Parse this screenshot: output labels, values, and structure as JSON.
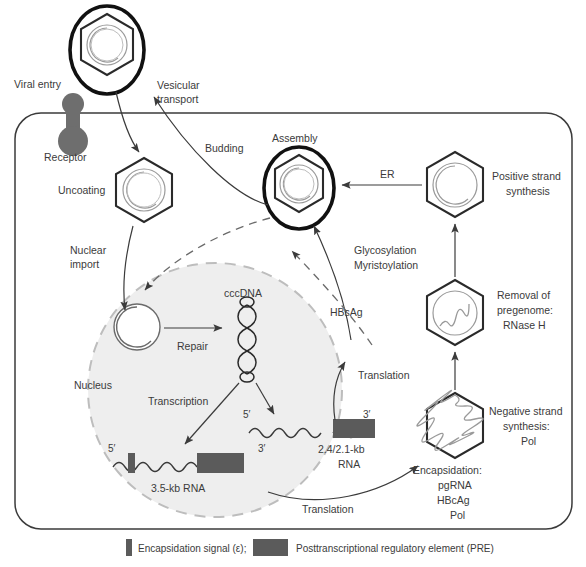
{
  "diagram": {
    "colors": {
      "stroke": "#3b3b3b",
      "envelope": "#1a1a1a",
      "nucleus_fill": "#eeeeee",
      "nucleus_stroke": "#b9b9b9",
      "receptor": "#6e6e6e",
      "pre_box": "#5b5b5b",
      "eps_bar": "#5b5b5b",
      "text": "#3b3b3b",
      "background": "#ffffff"
    },
    "labels": {
      "viral_entry": "Viral entry",
      "receptor": "Receptor",
      "vesicular_transport_line1": "Vesicular",
      "vesicular_transport_line2": "transport",
      "uncoating": "Uncoating",
      "budding": "Budding",
      "assembly": "Assembly",
      "er": "ER",
      "positive_strand_line1": "Positive strand",
      "positive_strand_line2": "synthesis",
      "nuclear_import_line1": "Nuclear",
      "nuclear_import_line2": "import",
      "nucleus": "Nucleus",
      "cccdna": "cccDNA",
      "repair": "Repair",
      "transcription": "Transcription",
      "glycosylation": "Glycosylation",
      "myristoylation": "Myristoylation",
      "hbsag": "HBsAg",
      "translation_upper": "Translation",
      "translation_lower": "Translation",
      "removal_line1": "Removal of",
      "removal_line2": "pregenome:",
      "removal_line3": "RNase H",
      "negative_strand_line1": "Negative strand",
      "negative_strand_line2": "synthesis:",
      "negative_strand_line3": "Pol",
      "encapsidation_line1": "Encapsidation:",
      "encapsidation_line2": "pgRNA",
      "encapsidation_line3": "HBcAg",
      "encapsidation_line4": "Pol",
      "rna_35_label": "3.5-kb RNA",
      "rna_24_line1": "2.4/2.1-kb",
      "rna_24_line2": "RNA",
      "five_prime_a": "5′",
      "three_prime_a": "3′",
      "five_prime_b": "5′",
      "three_prime_b": "3′"
    },
    "legend": [
      {
        "swatch": "eps-bar",
        "text": "Encapsidation signal (ε);"
      },
      {
        "swatch": "pre-box",
        "text": "Posttranscriptional regulatory element (PRE)"
      }
    ]
  }
}
